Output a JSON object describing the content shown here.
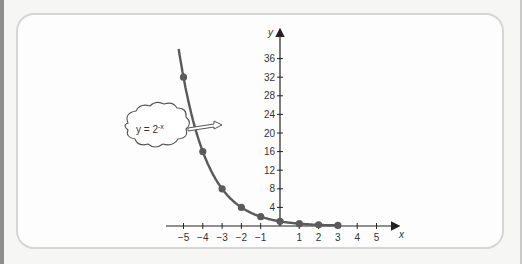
{
  "chart_data": {
    "type": "line",
    "title": "",
    "xlabel": "x",
    "ylabel": "y",
    "function_label": "y = 2^-x",
    "annotation": {
      "text_base": "y = 2",
      "text_exponent": "-x",
      "shape": "cloud-callout",
      "points_to": "curve near x=-4.4"
    },
    "x_ticks": [
      -5,
      -4,
      -3,
      -2,
      -1,
      1,
      2,
      3,
      4,
      5
    ],
    "x_tick_labels": [
      "−5",
      "−4",
      "−3",
      "−2",
      "−1",
      "1",
      "2",
      "3",
      "4",
      "5"
    ],
    "y_ticks": [
      4,
      8,
      12,
      16,
      20,
      24,
      28,
      32,
      36
    ],
    "y_tick_labels": [
      "4",
      "8",
      "12",
      "16",
      "20",
      "24",
      "28",
      "32",
      "36"
    ],
    "xlim": [
      -6,
      6
    ],
    "ylim": [
      0,
      40
    ],
    "grid": false,
    "legend": "none",
    "series": [
      {
        "name": "y = 2^-x",
        "x": [
          -5,
          -4,
          -3,
          -2,
          -1,
          0,
          1,
          2,
          3
        ],
        "values": [
          32,
          16,
          8,
          4,
          2,
          1,
          0.5,
          0.25,
          0.125
        ],
        "marker": "circle",
        "color": "#5a5a5a"
      }
    ]
  },
  "colors": {
    "curve": "#5a5a5a",
    "axis": "#333333",
    "panel_border": "#d6d6d6",
    "background": "#f6f6f5"
  }
}
